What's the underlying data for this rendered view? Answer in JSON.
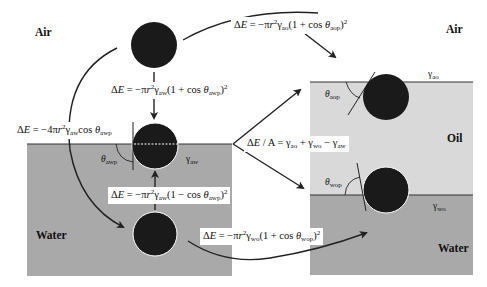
{
  "diagram": {
    "colors": {
      "water": "#a9a9a9",
      "oil": "#d9d9d9",
      "particle": "#1a1a1a",
      "line": "#222222",
      "background": "#ffffff"
    },
    "phase_labels": {
      "air_left": "Air",
      "water_left": "Water",
      "air_right": "Air",
      "oil_right": "Oil",
      "water_right": "Water"
    },
    "tensions": {
      "aw": "γaw",
      "ao": "γao",
      "wo": "γwo"
    },
    "angles": {
      "awp": "θawp",
      "aop": "θaop",
      "wop": "θwop"
    },
    "equations": {
      "air_to_interface": "ΔE = −πr²γaw(1 + cos θawp)²",
      "water_to_interface": "ΔE = −πr²γaw(1 − cos θawp)²",
      "air_to_water": "ΔE = −4πr²γaw cos θawp",
      "air_to_oil_interface": "ΔE = −πr²γao(1 + cos θaop)²",
      "water_to_oil_interface": "ΔE = −πr²γwo(1 + cos θwop)²",
      "spreading": "ΔE / A = γao + γwo − γaw"
    },
    "nodes": [
      {
        "id": "particle-in-air",
        "cx": 154,
        "cy": 45,
        "r": 23
      },
      {
        "id": "particle-at-air-water",
        "cx": 155,
        "cy": 146,
        "r": 23
      },
      {
        "id": "particle-in-water",
        "cx": 155,
        "cy": 234,
        "r": 22
      },
      {
        "id": "particle-at-air-oil",
        "cx": 386,
        "cy": 97,
        "r": 23
      },
      {
        "id": "particle-at-oil-water",
        "cx": 386,
        "cy": 190,
        "r": 23
      }
    ]
  }
}
